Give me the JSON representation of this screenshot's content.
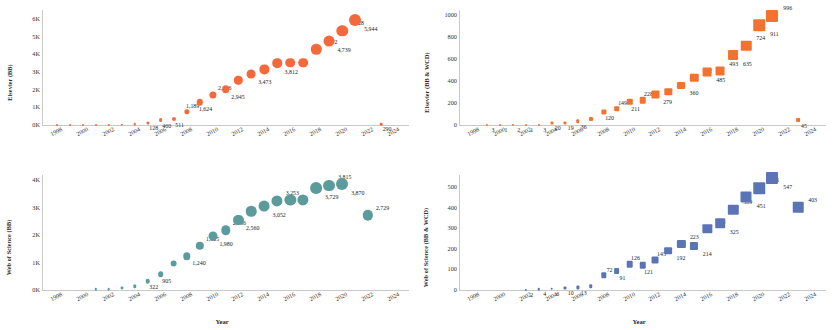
{
  "figure": {
    "panel_count": 4,
    "background": "#ffffff",
    "colors": {
      "elsevier_bb": "#F4693B",
      "elsevier_bb_wcd": "#F4722E",
      "wos_bb": "#5C9B9B",
      "wos_bb_wcd": "#5B74B5",
      "axis": "#c9c9c9",
      "text": "#1a1a1a"
    }
  },
  "chart_data": [
    {
      "id": "elsevier-bb",
      "position": "top-left",
      "type": "scatter",
      "marker": "circle",
      "color": "#F4693B",
      "title": "",
      "xlabel": "",
      "ylabel": "Elsevier (BB)",
      "xlim": [
        1997,
        2025
      ],
      "ylim": [
        0,
        6500
      ],
      "xticks": [
        1998,
        2000,
        2002,
        2004,
        2006,
        2008,
        2010,
        2012,
        2014,
        2016,
        2018,
        2020,
        2022,
        2024
      ],
      "yticks": [
        0,
        1000,
        2000,
        3000,
        4000,
        5000,
        6000
      ],
      "ytick_labels": [
        "0K",
        "1K",
        "2K",
        "3K",
        "4K",
        "5K",
        "6K"
      ],
      "grid": false,
      "points": [
        {
          "x": 1998,
          "y": 4,
          "label": ""
        },
        {
          "x": 1999,
          "y": 6,
          "label": ""
        },
        {
          "x": 2000,
          "y": 9,
          "label": ""
        },
        {
          "x": 2001,
          "y": 11,
          "label": ""
        },
        {
          "x": 2002,
          "y": 16,
          "label": ""
        },
        {
          "x": 2003,
          "y": 28,
          "label": ""
        },
        {
          "x": 2004,
          "y": 46,
          "label": ""
        },
        {
          "x": 2005,
          "y": 128,
          "label": "128"
        },
        {
          "x": 2006,
          "y": 272,
          "label": "460"
        },
        {
          "x": 2007,
          "y": 330,
          "label": "511"
        },
        {
          "x": 2008,
          "y": 760,
          "label": "1,189"
        },
        {
          "x": 2009,
          "y": 1290,
          "label": "1,624"
        },
        {
          "x": 2010,
          "y": 1720,
          "label": "2,276"
        },
        {
          "x": 2011,
          "y": 2010,
          "label": "2,945"
        },
        {
          "x": 2012,
          "y": 2520,
          "label": ""
        },
        {
          "x": 2013,
          "y": 2900,
          "label": "3,473"
        },
        {
          "x": 2014,
          "y": 3140,
          "label": ""
        },
        {
          "x": 2015,
          "y": 3480,
          "label": "3,812"
        },
        {
          "x": 2016,
          "y": 3520,
          "label": ""
        },
        {
          "x": 2017,
          "y": 3510,
          "label": ""
        },
        {
          "x": 2018,
          "y": 4272,
          "label": "4,272"
        },
        {
          "x": 2019,
          "y": 4739,
          "label": "4,739"
        },
        {
          "x": 2020,
          "y": 5328,
          "label": "5,328"
        },
        {
          "x": 2021,
          "y": 5944,
          "label": "5,944"
        },
        {
          "x": 2023,
          "y": 60,
          "label": "290"
        }
      ]
    },
    {
      "id": "elsevier-bb-wcd",
      "position": "top-right",
      "type": "scatter",
      "marker": "square",
      "color": "#F4722E",
      "title": "",
      "xlabel": "",
      "ylabel": "Elsevier (BB & WCD)",
      "xlim": [
        1997,
        2025
      ],
      "ylim": [
        0,
        1050
      ],
      "xticks": [
        1998,
        2000,
        2002,
        2004,
        2006,
        2008,
        2010,
        2012,
        2014,
        2016,
        2018,
        2020,
        2022,
        2024
      ],
      "yticks": [
        0,
        200,
        400,
        600,
        800,
        1000
      ],
      "ytick_labels": [
        "0",
        "200",
        "400",
        "600",
        "800",
        "1000"
      ],
      "grid": false,
      "points": [
        {
          "x": 1999,
          "y": 3,
          "label": "3"
        },
        {
          "x": 2000,
          "y": 1,
          "label": "1"
        },
        {
          "x": 2001,
          "y": 2,
          "label": "2"
        },
        {
          "x": 2002,
          "y": 1,
          "label": "1"
        },
        {
          "x": 2003,
          "y": 3,
          "label": "3"
        },
        {
          "x": 2004,
          "y": 20,
          "label": "20"
        },
        {
          "x": 2005,
          "y": 19,
          "label": "19"
        },
        {
          "x": 2006,
          "y": 36,
          "label": "36"
        },
        {
          "x": 2007,
          "y": 52,
          "label": ""
        },
        {
          "x": 2008,
          "y": 120,
          "label": "120"
        },
        {
          "x": 2009,
          "y": 149,
          "label": "149"
        },
        {
          "x": 2010,
          "y": 211,
          "label": "211"
        },
        {
          "x": 2011,
          "y": 228,
          "label": "228"
        },
        {
          "x": 2012,
          "y": 279,
          "label": "279"
        },
        {
          "x": 2013,
          "y": 305,
          "label": "305"
        },
        {
          "x": 2014,
          "y": 360,
          "label": "360"
        },
        {
          "x": 2015,
          "y": 432,
          "label": "432"
        },
        {
          "x": 2016,
          "y": 485,
          "label": "485"
        },
        {
          "x": 2017,
          "y": 493,
          "label": "493"
        },
        {
          "x": 2018,
          "y": 635,
          "label": "635"
        },
        {
          "x": 2019,
          "y": 724,
          "label": "724"
        },
        {
          "x": 2020,
          "y": 911,
          "label": "911"
        },
        {
          "x": 2021,
          "y": 996,
          "label": "996"
        },
        {
          "x": 2023,
          "y": 45,
          "label": "45"
        }
      ]
    },
    {
      "id": "wos-bb",
      "position": "bottom-left",
      "type": "scatter",
      "marker": "circle",
      "color": "#5C9B9B",
      "title": "",
      "xlabel": "Year",
      "ylabel": "Web of Science (BB)",
      "xlim": [
        1997,
        2025
      ],
      "ylim": [
        0,
        4200
      ],
      "xticks": [
        1998,
        2000,
        2002,
        2004,
        2006,
        2008,
        2010,
        2012,
        2014,
        2016,
        2018,
        2020,
        2022,
        2024
      ],
      "yticks": [
        0,
        1000,
        2000,
        3000,
        4000
      ],
      "ytick_labels": [
        "0K",
        "1K",
        "2K",
        "3K",
        "4K"
      ],
      "grid": false,
      "points": [
        {
          "x": 2001,
          "y": 25,
          "label": ""
        },
        {
          "x": 2002,
          "y": 40,
          "label": ""
        },
        {
          "x": 2003,
          "y": 70,
          "label": ""
        },
        {
          "x": 2004,
          "y": 130,
          "label": ""
        },
        {
          "x": 2005,
          "y": 322,
          "label": "322"
        },
        {
          "x": 2006,
          "y": 580,
          "label": "905"
        },
        {
          "x": 2007,
          "y": 960,
          "label": ""
        },
        {
          "x": 2008,
          "y": 1240,
          "label": "1,240"
        },
        {
          "x": 2009,
          "y": 1625,
          "label": "1,625"
        },
        {
          "x": 2010,
          "y": 1980,
          "label": "1,980"
        },
        {
          "x": 2011,
          "y": 2186,
          "label": "2,186"
        },
        {
          "x": 2012,
          "y": 2560,
          "label": "2,560"
        },
        {
          "x": 2013,
          "y": 2880,
          "label": ""
        },
        {
          "x": 2014,
          "y": 3052,
          "label": "3,052"
        },
        {
          "x": 2015,
          "y": 3253,
          "label": "3,253"
        },
        {
          "x": 2016,
          "y": 3290,
          "label": ""
        },
        {
          "x": 2017,
          "y": 3290,
          "label": ""
        },
        {
          "x": 2018,
          "y": 3729,
          "label": "3,729"
        },
        {
          "x": 2019,
          "y": 3815,
          "label": "3,815"
        },
        {
          "x": 2020,
          "y": 3870,
          "label": "3,870"
        },
        {
          "x": 2022,
          "y": 2729,
          "label": "2,729"
        }
      ]
    },
    {
      "id": "wos-bb-wcd",
      "position": "bottom-right",
      "type": "scatter",
      "marker": "square",
      "color": "#5B74B5",
      "title": "",
      "xlabel": "Year",
      "ylabel": "Web of Science (BB & WCD)",
      "xlim": [
        1997,
        2025
      ],
      "ylim": [
        0,
        560
      ],
      "xticks": [
        1998,
        2000,
        2002,
        2004,
        2006,
        2008,
        2010,
        2012,
        2014,
        2016,
        2018,
        2020,
        2022,
        2024
      ],
      "yticks": [
        0,
        100,
        200,
        300,
        400,
        500
      ],
      "ytick_labels": [
        "0",
        "100",
        "200",
        "300",
        "400",
        "500"
      ],
      "grid": false,
      "points": [
        {
          "x": 2002,
          "y": 2,
          "label": "2"
        },
        {
          "x": 2003,
          "y": 4,
          "label": "4"
        },
        {
          "x": 2004,
          "y": 6,
          "label": "6"
        },
        {
          "x": 2005,
          "y": 10,
          "label": "10"
        },
        {
          "x": 2006,
          "y": 13,
          "label": "13"
        },
        {
          "x": 2007,
          "y": 18,
          "label": ""
        },
        {
          "x": 2008,
          "y": 72,
          "label": "72"
        },
        {
          "x": 2009,
          "y": 91,
          "label": "91"
        },
        {
          "x": 2010,
          "y": 126,
          "label": "126"
        },
        {
          "x": 2011,
          "y": 121,
          "label": "121"
        },
        {
          "x": 2012,
          "y": 145,
          "label": "145"
        },
        {
          "x": 2013,
          "y": 192,
          "label": "192"
        },
        {
          "x": 2014,
          "y": 223,
          "label": "223"
        },
        {
          "x": 2015,
          "y": 214,
          "label": "214"
        },
        {
          "x": 2016,
          "y": 298,
          "label": "298"
        },
        {
          "x": 2017,
          "y": 325,
          "label": "325"
        },
        {
          "x": 2018,
          "y": 389,
          "label": "389"
        },
        {
          "x": 2019,
          "y": 451,
          "label": "451"
        },
        {
          "x": 2020,
          "y": 496,
          "label": "496"
        },
        {
          "x": 2021,
          "y": 547,
          "label": "547"
        },
        {
          "x": 2023,
          "y": 403,
          "label": "403"
        }
      ]
    }
  ]
}
